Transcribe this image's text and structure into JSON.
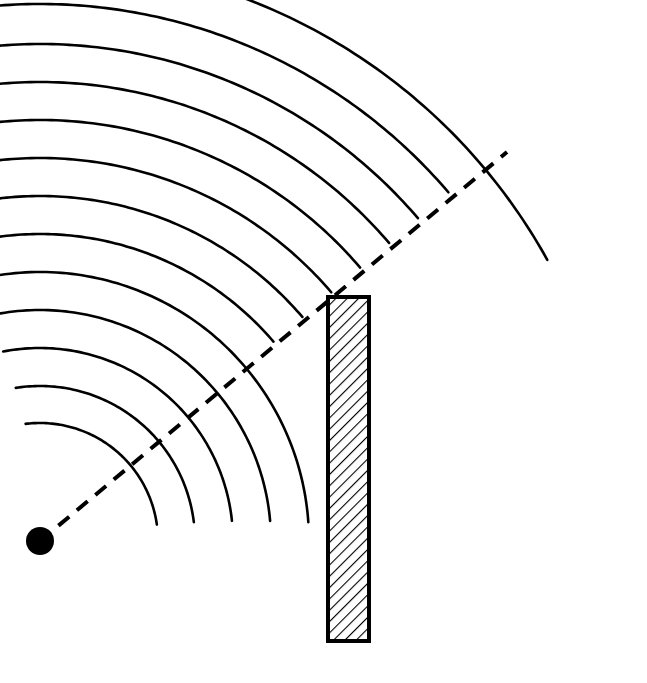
{
  "figure": {
    "width": 647,
    "height": 683,
    "background_color": "#ffffff",
    "stroke_color": "#000000"
  },
  "source": {
    "label": "point-source",
    "cx": 40,
    "cy": 541,
    "r": 14,
    "fill": "#000000"
  },
  "barrier": {
    "label": "barrier",
    "x": 326,
    "y": 295,
    "width": 45,
    "height": 348,
    "outline_color": "#000000",
    "outline_width": 4,
    "fill_color": "#ffffff",
    "hatch_color": "#000000",
    "hatch_angle_deg": 45,
    "hatch_spacing": 8,
    "hatch_width": 2.2
  },
  "ray": {
    "label": "shadow-boundary-ray",
    "x1": 40,
    "y1": 541,
    "x2": 507,
    "y2": 152,
    "dash_pattern": "14 10",
    "stroke_width": 4,
    "color": "#000000"
  },
  "wavefronts": {
    "label": "wavefronts",
    "center_x": 40,
    "center_y": 541,
    "stroke_width": 2.6,
    "color": "#000000",
    "count": 13,
    "arcs": [
      {
        "r": 118,
        "a_start": -97,
        "a_end": -8
      },
      {
        "r": 155,
        "a_start": -99,
        "a_end": -7
      },
      {
        "r": 193,
        "a_start": -101,
        "a_end": -6
      },
      {
        "r": 231,
        "a_start": -102,
        "a_end": -5
      },
      {
        "r": 269,
        "a_start": -103,
        "a_end": -4
      },
      {
        "r": 307,
        "a_start": -104,
        "a_end": -40.5
      },
      {
        "r": 345,
        "a_start": -104,
        "a_end": -40.5
      },
      {
        "r": 383,
        "a_start": -104,
        "a_end": -40.5
      },
      {
        "r": 421,
        "a_start": -104,
        "a_end": -40.5
      },
      {
        "r": 459,
        "a_start": -103,
        "a_end": -40.5
      },
      {
        "r": 497,
        "a_start": -99,
        "a_end": -40.5
      },
      {
        "r": 537,
        "a_start": -95,
        "a_end": -40.5
      },
      {
        "r": 580,
        "a_start": -88,
        "a_end": -29
      }
    ]
  }
}
